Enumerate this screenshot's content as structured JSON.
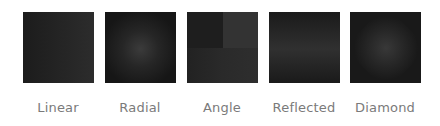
{
  "gradients": [
    {
      "type": "linear",
      "label": "Linear"
    },
    {
      "type": "radial",
      "label": "Radial"
    },
    {
      "type": "angle",
      "label": "Angle"
    },
    {
      "type": "reflected",
      "label": "Reflected"
    },
    {
      "type": "diamond",
      "label": "Diamond"
    }
  ],
  "colors": {
    "background": "#ffffff",
    "label": "#7a7a7a",
    "swatch_dark": "#1a1a1a",
    "swatch_light": "#333333"
  }
}
